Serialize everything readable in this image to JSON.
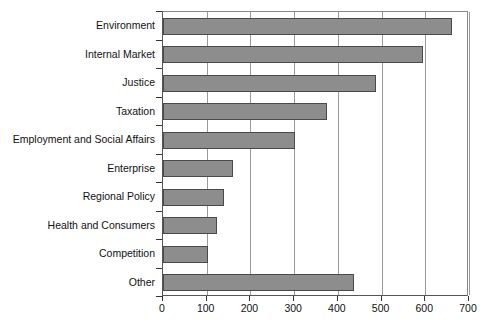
{
  "chart_data": {
    "type": "bar",
    "orientation": "horizontal",
    "title": "",
    "xlabel": "",
    "ylabel": "",
    "categories": [
      "Environment",
      "Internal Market",
      "Justice",
      "Taxation",
      "Employment and Social Affairs",
      "Enterprise",
      "Regional Policy",
      "Health and Consumers",
      "Competition",
      "Other"
    ],
    "values": [
      660,
      595,
      487,
      375,
      302,
      161,
      140,
      124,
      104,
      436
    ],
    "xlim": [
      0,
      700
    ],
    "xticks": [
      0,
      100,
      200,
      300,
      400,
      500,
      600,
      700
    ],
    "xticklabels": [
      "0",
      "100",
      "200",
      "300",
      "400",
      "500",
      "600",
      "700"
    ],
    "grid": "vertical",
    "legend": null,
    "bar_color": "#8d8d8d",
    "bar_edge_color": "#4a4a4a",
    "axis_color": "#555555",
    "grid_color": "#9a9a9a"
  }
}
